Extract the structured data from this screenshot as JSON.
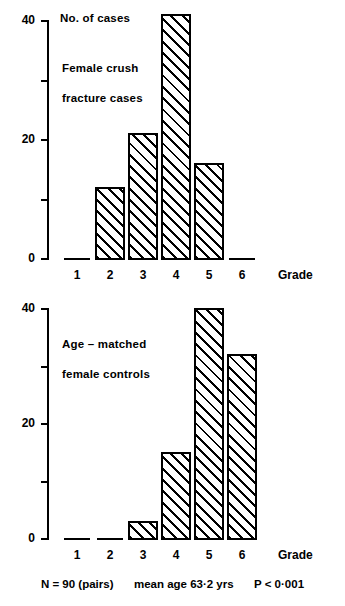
{
  "figure": {
    "caption": {
      "n_label": "N = 90  (pairs)",
      "mean_age_label": "mean  age  63·2 yrs",
      "p_label": "P < 0·001"
    }
  },
  "chart_data": [
    {
      "type": "bar",
      "panel": "top",
      "title": "No. of cases",
      "annotation_line1": "Female  crush",
      "annotation_line2": "fracture  cases",
      "xlabel": "Grade",
      "ylabel": "No. of cases",
      "categories": [
        "1",
        "2",
        "3",
        "4",
        "5",
        "6"
      ],
      "values": [
        0,
        12,
        21,
        41,
        16,
        0
      ],
      "ylim": [
        0,
        42
      ],
      "yticks_major": [
        0,
        20,
        40
      ],
      "yticks_minor": [
        10,
        30
      ],
      "ytick_labels": [
        "0",
        "20",
        "40"
      ],
      "grid": false,
      "legend": "none"
    },
    {
      "type": "bar",
      "panel": "bottom",
      "title": "Age – matched female controls",
      "annotation_line1": "Age – matched",
      "annotation_line2": "female  controls",
      "xlabel": "Grade",
      "ylabel": "No. of cases",
      "categories": [
        "1",
        "2",
        "3",
        "4",
        "5",
        "6"
      ],
      "values": [
        0,
        0,
        3,
        15,
        40,
        32
      ],
      "ylim": [
        0,
        42
      ],
      "yticks_major": [
        0,
        20,
        40
      ],
      "yticks_minor": [
        10,
        30
      ],
      "ytick_labels": [
        "0",
        "20",
        "40"
      ],
      "grid": false,
      "legend": "none"
    }
  ]
}
